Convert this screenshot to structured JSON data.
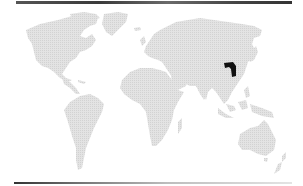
{
  "map": {
    "type": "world-locator",
    "projection": "equirectangular-like",
    "colors": {
      "land": "#dcdcdc",
      "highlight": "#111111",
      "background": "#ffffff",
      "rules": "#3a3a3a"
    },
    "highlighted_region": {
      "name": "region in central China",
      "approx_bbox_px": [
        224,
        62,
        236,
        77
      ]
    },
    "continents": [
      "North America",
      "Greenland",
      "South America",
      "Europe",
      "Africa",
      "Asia",
      "Australia",
      "New Zealand",
      "Maritime Southeast Asia"
    ]
  }
}
